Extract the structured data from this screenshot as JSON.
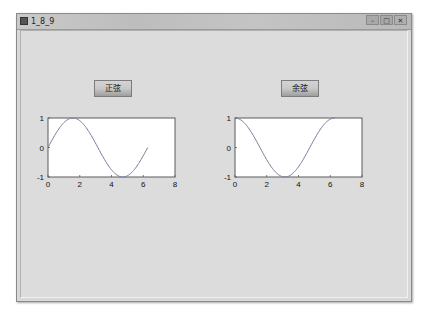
{
  "window": {
    "title": "1_8_9",
    "controls": {
      "minimize": "–",
      "maximize": "□",
      "close": "✕"
    }
  },
  "buttons": {
    "sine_label": "正弦",
    "cosine_label": "余弦"
  },
  "chart_data": [
    {
      "type": "line",
      "title": "",
      "xlabel": "",
      "ylabel": "",
      "xlim": [
        0,
        8
      ],
      "ylim": [
        -1,
        1
      ],
      "xticks": [
        "0",
        "2",
        "4",
        "6",
        "8"
      ],
      "yticks": [
        "-1",
        "0",
        "1"
      ],
      "grid": false,
      "series": [
        {
          "name": "sin(x)",
          "function": "sin",
          "x_range": [
            0,
            6.2832
          ],
          "x": [
            0,
            0.785,
            1.571,
            2.356,
            3.142,
            3.927,
            4.712,
            5.498,
            6.283
          ],
          "values": [
            0,
            0.707,
            1,
            0.707,
            0,
            -0.707,
            -1,
            -0.707,
            0
          ],
          "color": "#7a7a9a"
        }
      ]
    },
    {
      "type": "line",
      "title": "",
      "xlabel": "",
      "ylabel": "",
      "xlim": [
        0,
        8
      ],
      "ylim": [
        -1,
        1
      ],
      "xticks": [
        "0",
        "2",
        "4",
        "6",
        "8"
      ],
      "yticks": [
        "-1",
        "0",
        "1"
      ],
      "grid": false,
      "series": [
        {
          "name": "cos(x)",
          "function": "cos",
          "x_range": [
            0,
            6.2832
          ],
          "x": [
            0,
            0.785,
            1.571,
            2.356,
            3.142,
            3.927,
            4.712,
            5.498,
            6.283
          ],
          "values": [
            1,
            0.707,
            0,
            -0.707,
            -1,
            -0.707,
            0,
            0.707,
            1
          ],
          "color": "#7a7a9a"
        }
      ]
    }
  ]
}
